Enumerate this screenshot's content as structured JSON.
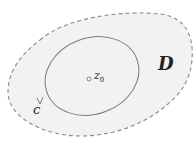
{
  "diagram": {
    "region_label": "D",
    "contour_label": "c",
    "point_label": "z",
    "point_subscript": "0",
    "colors": {
      "region_fill": "#f2f2f2",
      "region_border": "#8a8a8a",
      "contour": "#7a7a7a",
      "text": "#222222"
    }
  }
}
